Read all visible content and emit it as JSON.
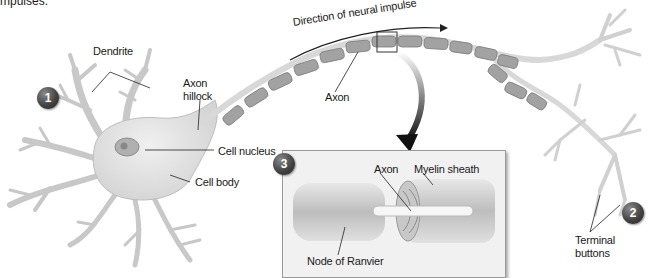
{
  "caption_fragment": "mpulses.",
  "labels": {
    "dendrite": "Dendrite",
    "axon_hillock_line1": "Axon",
    "axon_hillock_line2": "hillock",
    "cell_nucleus": "Cell nucleus",
    "cell_body": "Cell body",
    "direction": "Direction of neural impulse",
    "axon_main": "Axon",
    "inset_axon": "Axon",
    "myelin_sheath": "Myelin sheath",
    "node_of_ranvier": "Node of Ranvier",
    "terminal_line1": "Terminal",
    "terminal_line2": "buttons"
  },
  "badges": [
    "1",
    "2",
    "3"
  ],
  "colors": {
    "neuron_fill": "#e6e6e6",
    "neuron_stroke": "#b4b4b4",
    "myelin_fill": "#9c9c9c",
    "myelin_stroke": "#7a7a7a",
    "badge_dark": "#333333",
    "inset_bg": "#f1f1f1",
    "arrow": "#222222"
  }
}
